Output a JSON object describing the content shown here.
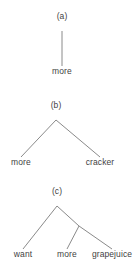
{
  "figure": {
    "width": 139,
    "height": 270,
    "background_color": "#ffffff",
    "line_color": "#8a8a8a",
    "text_color": "#3f3f3f",
    "type": "syntactic-tree-diagram",
    "panel_count": 3
  },
  "trees": [
    {
      "id": "a",
      "tag": "(a)",
      "tag_x": 62,
      "tag_y": 18,
      "root_x": 62,
      "root_y": 31,
      "leaf_y": 66,
      "leaves": [
        {
          "label": "more",
          "x": 62
        }
      ],
      "edges": [
        {
          "x1": 62,
          "y1": 31,
          "x2": 62,
          "y2": 66
        }
      ],
      "internal_nodes": []
    },
    {
      "id": "b",
      "tag": "(b)",
      "tag_x": 56,
      "tag_y": 107,
      "root_x": 56,
      "root_y": 120,
      "leaf_y": 157,
      "leaves": [
        {
          "label": "more",
          "x": 21
        },
        {
          "label": "cracker",
          "x": 100
        }
      ],
      "edges": [
        {
          "x1": 56,
          "y1": 120,
          "x2": 21,
          "y2": 157
        },
        {
          "x1": 56,
          "y1": 120,
          "x2": 100,
          "y2": 157
        }
      ],
      "internal_nodes": []
    },
    {
      "id": "c",
      "tag": "(c)",
      "tag_x": 57,
      "tag_y": 193,
      "root_x": 57,
      "root_y": 206,
      "leaf_y": 249,
      "leaves": [
        {
          "label": "want",
          "x": 23
        },
        {
          "label": "more",
          "x": 67
        },
        {
          "label": "grapejuice",
          "x": 112
        }
      ],
      "edges": [
        {
          "x1": 57,
          "y1": 206,
          "x2": 23,
          "y2": 249
        },
        {
          "x1": 57,
          "y1": 206,
          "x2": 79,
          "y2": 226
        },
        {
          "x1": 79,
          "y1": 226,
          "x2": 67,
          "y2": 249
        },
        {
          "x1": 79,
          "y1": 226,
          "x2": 112,
          "y2": 249
        }
      ],
      "internal_nodes": [
        {
          "x": 79,
          "y": 226
        }
      ]
    }
  ]
}
